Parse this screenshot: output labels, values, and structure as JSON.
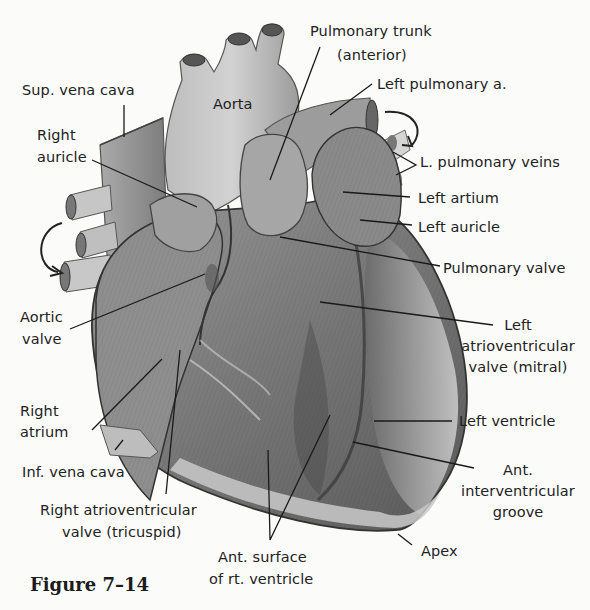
{
  "figure": {
    "caption": "Figure 7–14",
    "colors": {
      "background": "#fbfbfa",
      "ink": "#222222",
      "tissue_dark": "#5e5e5e",
      "tissue_mid": "#8a8a8a",
      "tissue_light": "#c4c4c4"
    }
  },
  "labels": {
    "sup_vena_cava": "Sup. vena cava",
    "aorta": "Aorta",
    "pulmonary_trunk_1": "Pulmonary trunk",
    "pulmonary_trunk_2": "(anterior)",
    "left_pulmonary_a": "Left pulmonary a.",
    "right_auricle_1": "Right",
    "right_auricle_2": "auricle",
    "l_pulmonary_veins": "L. pulmonary veins",
    "left_atrium": "Left artium",
    "left_auricle": "Left auricle",
    "pulmonary_valve": "Pulmonary valve",
    "aortic_valve_1": "Aortic",
    "aortic_valve_2": "valve",
    "mitral_1": "Left",
    "mitral_2": "atrioventricular",
    "mitral_3": "valve (mitral)",
    "right_atrium_1": "Right",
    "right_atrium_2": "atrium",
    "left_ventricle": "Left ventricle",
    "inf_vena_cava": "Inf. vena cava",
    "ant_groove_1": "Ant.",
    "ant_groove_2": "interventricular",
    "ant_groove_3": "groove",
    "tricuspid_1": "Right atrioventricular",
    "tricuspid_2": "valve (tricuspid)",
    "apex": "Apex",
    "ant_surface_1": "Ant. surface",
    "ant_surface_2": "of rt. ventricle"
  }
}
